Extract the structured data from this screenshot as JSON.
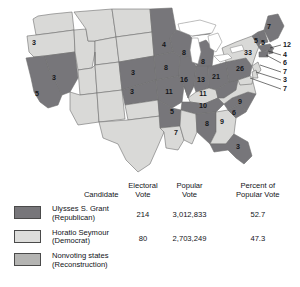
{
  "map": {
    "title": "Electoral map of the 1868 United States presidential election",
    "colors": {
      "grant": "#77767a",
      "seymour": "#d9d9d7",
      "nonvoting": "#b0b0ae",
      "border": "#6f6f6f",
      "lake": "#ffffff",
      "background": "#ffffff",
      "label_text": "#15161a"
    },
    "states": [
      {
        "code": "OR",
        "name": "Oregon",
        "votes": "3",
        "party": "seymour",
        "x": 34,
        "y": 43
      },
      {
        "code": "NV",
        "name": "Nevada",
        "votes": "3",
        "party": "grant",
        "x": 54,
        "y": 78
      },
      {
        "code": "CA",
        "name": "California",
        "votes": "5",
        "party": "grant",
        "x": 37,
        "y": 94
      },
      {
        "code": "MN",
        "name": "Minnesota",
        "votes": "4",
        "party": "grant",
        "x": 164,
        "y": 45
      },
      {
        "code": "WI",
        "name": "Wisconsin",
        "votes": "8",
        "party": "grant",
        "x": 184,
        "y": 53
      },
      {
        "code": "MI",
        "name": "Michigan",
        "votes": "8",
        "party": "grant",
        "x": 203,
        "y": 62
      },
      {
        "code": "IA",
        "name": "Iowa",
        "votes": "8",
        "party": "grant",
        "x": 166,
        "y": 68
      },
      {
        "code": "NE",
        "name": "Nebraska",
        "votes": "3",
        "party": "grant",
        "x": 133,
        "y": 73
      },
      {
        "code": "KS",
        "name": "Kansas",
        "votes": "3",
        "party": "grant",
        "x": 132,
        "y": 92
      },
      {
        "code": "IL",
        "name": "Illinois",
        "votes": "16",
        "party": "grant",
        "x": 184,
        "y": 80
      },
      {
        "code": "IN",
        "name": "Indiana",
        "votes": "13",
        "party": "grant",
        "x": 201,
        "y": 80
      },
      {
        "code": "OH",
        "name": "Ohio",
        "votes": "21",
        "party": "grant",
        "x": 216,
        "y": 77
      },
      {
        "code": "MO",
        "name": "Missouri",
        "votes": "11",
        "party": "grant",
        "x": 169,
        "y": 92
      },
      {
        "code": "KY",
        "name": "Kentucky",
        "votes": "11",
        "party": "seymour",
        "x": 203,
        "y": 94
      },
      {
        "code": "TN",
        "name": "Tennessee",
        "votes": "10",
        "party": "grant",
        "x": 203,
        "y": 106
      },
      {
        "code": "AR",
        "name": "Arkansas",
        "votes": "5",
        "party": "grant",
        "x": 172,
        "y": 112
      },
      {
        "code": "LA",
        "name": "Louisiana",
        "votes": "7",
        "party": "seymour",
        "x": 176,
        "y": 133
      },
      {
        "code": "AL",
        "name": "Alabama",
        "votes": "8",
        "party": "grant",
        "x": 207,
        "y": 124
      },
      {
        "code": "GA",
        "name": "Georgia",
        "votes": "9",
        "party": "seymour",
        "x": 222,
        "y": 122
      },
      {
        "code": "SC",
        "name": "South Carolina",
        "votes": "6",
        "party": "grant",
        "x": 234,
        "y": 113
      },
      {
        "code": "NC",
        "name": "North Carolina",
        "votes": "9",
        "party": "grant",
        "x": 240,
        "y": 102
      },
      {
        "code": "FL",
        "name": "Florida",
        "votes": "3",
        "party": "grant",
        "x": 238,
        "y": 147
      },
      {
        "code": "PA",
        "name": "Pennsylvania",
        "votes": "26",
        "party": "grant",
        "x": 240,
        "y": 69
      },
      {
        "code": "NY",
        "name": "New York",
        "votes": "33",
        "party": "seymour",
        "x": 248,
        "y": 53
      },
      {
        "code": "VT",
        "name": "Vermont",
        "votes": "5",
        "party": "grant",
        "x": 256,
        "y": 41
      },
      {
        "code": "NH",
        "name": "New Hampshire",
        "votes": "5",
        "party": "grant",
        "x": 263,
        "y": 43
      },
      {
        "code": "ME",
        "name": "Maine",
        "votes": "7",
        "party": "grant",
        "x": 269,
        "y": 27
      }
    ],
    "callouts": [
      {
        "code": "MA",
        "name": "Massachusetts",
        "votes": "12",
        "party": "grant",
        "lx": 283,
        "ly": 45,
        "px": 270,
        "py": 48
      },
      {
        "code": "RI",
        "name": "Rhode Island",
        "votes": "4",
        "party": "grant",
        "lx": 283,
        "ly": 55,
        "px": 268,
        "py": 51
      },
      {
        "code": "CT",
        "name": "Connecticut",
        "votes": "6",
        "party": "grant",
        "lx": 283,
        "ly": 63,
        "px": 266,
        "py": 54
      },
      {
        "code": "NJ",
        "name": "New Jersey",
        "votes": "7",
        "party": "seymour",
        "lx": 283,
        "ly": 72,
        "px": 260,
        "py": 64
      },
      {
        "code": "DE",
        "name": "Delaware",
        "votes": "3",
        "party": "seymour",
        "lx": 283,
        "ly": 80,
        "px": 256,
        "py": 70
      },
      {
        "code": "MD",
        "name": "Maryland",
        "votes": "7",
        "party": "seymour",
        "lx": 283,
        "ly": 89,
        "px": 252,
        "py": 75
      }
    ]
  },
  "table": {
    "headers": {
      "candidate": "Candidate",
      "electoral_vote": "Electoral\nVote",
      "electoral_vote_l1": "Electoral",
      "electoral_vote_l2": "Vote",
      "popular_vote_l1": "Popular",
      "popular_vote_l2": "Vote",
      "percent_l1": "Percent of",
      "percent_l2": "Popular Vote"
    },
    "rows": [
      {
        "swatch": "grant",
        "name_line1": "Ulysses S. Grant",
        "name_line2": "(Republican)",
        "electoral_vote": "214",
        "popular_vote": "3,012,833",
        "percent_popular_vote": "52.7"
      },
      {
        "swatch": "seymour",
        "name_line1": "Horatio Seymour",
        "name_line2": "(Democrat)",
        "electoral_vote": "80",
        "popular_vote": "2,703,249",
        "percent_popular_vote": "47.3"
      },
      {
        "swatch": "nonvote",
        "name_line1": "Nonvoting states",
        "name_line2": "(Reconstruction)",
        "electoral_vote": "",
        "popular_vote": "",
        "percent_popular_vote": ""
      }
    ]
  }
}
